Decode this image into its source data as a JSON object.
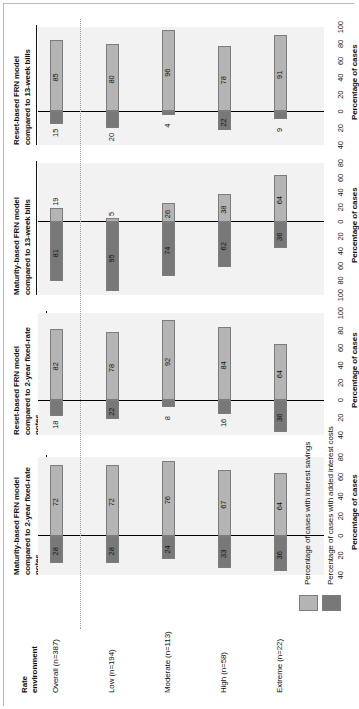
{
  "figure": {
    "row_header_title": "Rate\nenvironment",
    "row_header_line1": "Rate",
    "row_header_line2": "environment",
    "axis_title": "Percentage of cases",
    "legend": {
      "positive_label": "Percentage of cases with interest savings",
      "negative_label": "Percentage of cases with added interest costs",
      "positive_color": "#b4b4b4",
      "negative_color": "#787878"
    },
    "categories": [
      "Overall (n=387)",
      "Low (n=194)",
      "Moderate (n=113)",
      "High (n=58)",
      "Extreme (n=22)"
    ]
  },
  "chart_data": {
    "type": "bar",
    "orientation": "horizontal-diverging",
    "xlabel": "Percentage of cases",
    "ylabel": "Rate environment",
    "grid": false,
    "legend_position": "bottom",
    "categories": [
      "Overall (n=387)",
      "Low (n=194)",
      "Moderate (n=113)",
      "High (n=58)",
      "Extreme (n=22)"
    ],
    "series": [
      {
        "name": "Percentage of cases with interest savings",
        "color": "#b4b4b4"
      },
      {
        "name": "Percentage of cases with added interest costs",
        "color": "#787878"
      }
    ],
    "panels": [
      {
        "id": "panel-1",
        "title_line1": "Maturity-based FRN model",
        "title_line2": "compared to 2-year fixed-rate",
        "title_line3": "notes",
        "title": "Maturity-based FRN model compared to 2-year fixed-rate notes",
        "xlim": [
          -40,
          80
        ],
        "ticks": [
          "40",
          "20",
          "0",
          "20",
          "40",
          "60",
          "80"
        ],
        "tick_values": [
          -40,
          -20,
          0,
          20,
          40,
          60,
          80
        ],
        "savings": [
          72,
          72,
          76,
          67,
          64
        ],
        "costs": [
          28,
          28,
          24,
          33,
          36
        ]
      },
      {
        "id": "panel-2",
        "title_line1": "Reset-based FRN model",
        "title_line2": "compared to 2-year fixed-rate",
        "title_line3": "notes",
        "title": "Reset-based FRN model compared to 2-year fixed-rate notes",
        "xlim": [
          -40,
          100
        ],
        "ticks": [
          "40",
          "20",
          "0",
          "20",
          "40",
          "60",
          "80",
          "100"
        ],
        "tick_values": [
          -40,
          -20,
          0,
          20,
          40,
          60,
          80,
          100
        ],
        "savings": [
          82,
          78,
          92,
          84,
          64
        ],
        "costs": [
          18,
          22,
          8,
          16,
          36
        ]
      },
      {
        "id": "panel-3",
        "title_line1": "Maturity-based FRN model",
        "title_line2": "compared to 13-week bills",
        "title_line3": "",
        "title": "Maturity-based FRN model compared to 13-week bills",
        "xlim": [
          -100,
          80
        ],
        "ticks": [
          "100",
          "80",
          "60",
          "40",
          "20",
          "0",
          "20",
          "40",
          "60",
          "80"
        ],
        "tick_values": [
          -100,
          -80,
          -60,
          -40,
          -20,
          0,
          20,
          40,
          60,
          80
        ],
        "savings": [
          19,
          5,
          26,
          38,
          64
        ],
        "costs": [
          81,
          95,
          74,
          62,
          36
        ]
      },
      {
        "id": "panel-4",
        "title_line1": "Reset-based FRN model",
        "title_line2": "compared to 13-week bills",
        "title_line3": "",
        "title": "Reset-based FRN model compared to 13-week bills",
        "xlim": [
          -40,
          100
        ],
        "ticks": [
          "40",
          "20",
          "0",
          "20",
          "40",
          "60",
          "80",
          "100"
        ],
        "tick_values": [
          -40,
          -20,
          0,
          20,
          40,
          60,
          80,
          100
        ],
        "savings": [
          85,
          80,
          96,
          78,
          91
        ],
        "costs": [
          15,
          20,
          4,
          22,
          9
        ]
      }
    ]
  }
}
